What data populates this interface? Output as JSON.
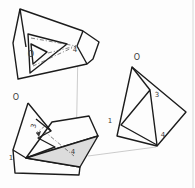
{
  "canvas": {
    "width_px": 195,
    "height_px": 188,
    "background": "#fdfdfd",
    "page_edge_color": "#d8d8d8"
  },
  "colors": {
    "line": "#1c1c1c",
    "dash_line": "#4a4a4a",
    "connector_line": "#a9a9a9",
    "shaded_face": "#dcdcdc",
    "label_text": "#3a3a3a"
  },
  "diagram": {
    "figures": {
      "top": {
        "name": "folded-shape-top-left",
        "origin_label": "O",
        "labels": {
          "l4": "4"
        }
      },
      "bottom": {
        "name": "folded-shape-bottom-left",
        "origin_label": "O",
        "labels": {
          "l3": "3",
          "l1": "1",
          "l4": "4"
        },
        "shaded_face": true
      },
      "right": {
        "name": "folded-shape-right",
        "origin_label": "O",
        "labels": {
          "l3": "3",
          "l1": "1",
          "l4": "4"
        }
      }
    },
    "connectors": [
      {
        "from": "top.4",
        "to": "bottom.4"
      },
      {
        "from": "right.bottom-vertex",
        "to": "bottom.4"
      }
    ]
  }
}
